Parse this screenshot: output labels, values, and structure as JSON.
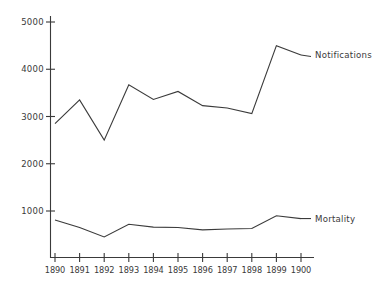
{
  "chart_data": {
    "type": "line",
    "title": "",
    "subtitle": "",
    "xlabel": "",
    "ylabel": "",
    "x": [
      1890,
      1891,
      1892,
      1893,
      1894,
      1895,
      1896,
      1897,
      1898,
      1899,
      1900
    ],
    "xtick_labels": [
      "1890",
      "1891",
      "1892",
      "1893",
      "1894",
      "1895",
      "1896",
      "1897",
      "1898",
      "1899",
      "1900"
    ],
    "ytick_labels": [
      "1000",
      "2000",
      "3000",
      "4000",
      "5000"
    ],
    "ytick_values": [
      1000,
      2000,
      3000,
      4000,
      5000
    ],
    "ylim": [
      0,
      5300
    ],
    "xlim": [
      1889.6,
      1900.8
    ],
    "grid": false,
    "legend_position": "inline-right",
    "series": [
      {
        "name": "Notifications",
        "label": "Notifications",
        "color": "#3b3b3b",
        "values": [
          2850,
          3350,
          2500,
          3670,
          3360,
          3530,
          3230,
          3180,
          3060,
          4500,
          4300
        ]
      },
      {
        "name": "Mortality",
        "label": "Mortality",
        "color": "#3b3b3b",
        "values": [
          810,
          650,
          450,
          720,
          660,
          650,
          600,
          620,
          630,
          900,
          840
        ]
      }
    ],
    "annotations": [
      {
        "text": "Notifications",
        "anchor_x": 1900,
        "anchor_y": 4300
      },
      {
        "text": "Mortality",
        "anchor_x": 1900,
        "anchor_y": 840
      }
    ]
  },
  "axes": {
    "y_axis_name": "y-axis",
    "x_axis_name": "x-axis"
  }
}
